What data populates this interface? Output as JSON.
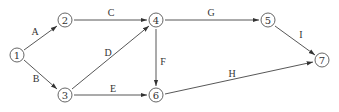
{
  "diagram": {
    "type": "activity-on-arrow network",
    "nodes": [
      {
        "id": "1",
        "label": "1",
        "x": 17,
        "y": 55
      },
      {
        "id": "2",
        "label": "2",
        "x": 65,
        "y": 20
      },
      {
        "id": "3",
        "label": "3",
        "x": 65,
        "y": 95
      },
      {
        "id": "4",
        "label": "4",
        "x": 156,
        "y": 20
      },
      {
        "id": "5",
        "label": "5",
        "x": 268,
        "y": 20
      },
      {
        "id": "6",
        "label": "6",
        "x": 156,
        "y": 95
      },
      {
        "id": "7",
        "label": "7",
        "x": 322,
        "y": 60
      }
    ],
    "edges": [
      {
        "from": "1",
        "to": "2",
        "label": "A"
      },
      {
        "from": "1",
        "to": "3",
        "label": "B"
      },
      {
        "from": "2",
        "to": "4",
        "label": "C"
      },
      {
        "from": "3",
        "to": "4",
        "label": "D"
      },
      {
        "from": "3",
        "to": "6",
        "label": "E"
      },
      {
        "from": "4",
        "to": "6",
        "label": "F"
      },
      {
        "from": "4",
        "to": "5",
        "label": "G"
      },
      {
        "from": "6",
        "to": "7",
        "label": "H"
      },
      {
        "from": "5",
        "to": "7",
        "label": "I"
      }
    ]
  }
}
